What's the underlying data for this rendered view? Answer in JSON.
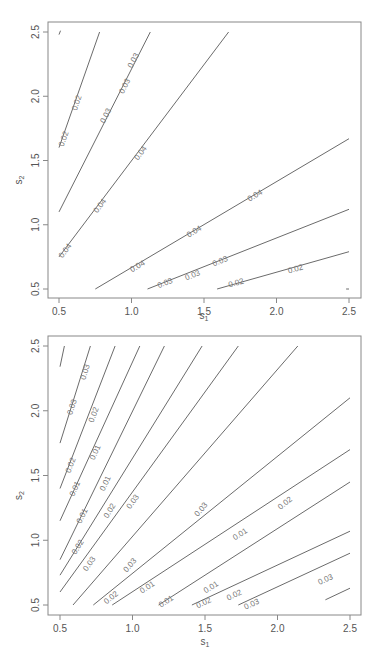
{
  "chart_data": [
    {
      "type": "contour",
      "title": "",
      "xlabel": "s1",
      "ylabel": "s2",
      "xlim": [
        0.45,
        2.58
      ],
      "ylim": [
        0.42,
        2.58
      ],
      "xticks": [
        "0.5",
        "1.0",
        "1.5",
        "2.0",
        "2.5"
      ],
      "yticks": [
        "0.5",
        "1.0",
        "1.5",
        "2.0",
        "2.5"
      ],
      "grid": false,
      "contours": [
        {
          "label": "0.02",
          "points": [
            [
              0.5,
              1.6
            ],
            [
              0.78,
              2.5
            ]
          ],
          "label_positions": [
            [
              0.53,
              1.67
            ],
            [
              0.62,
              1.95
            ]
          ]
        },
        {
          "label": "0.03",
          "points": [
            [
              0.5,
              1.1
            ],
            [
              1.13,
              2.5
            ]
          ],
          "label_positions": [
            [
              0.82,
              1.85
            ],
            [
              0.95,
              2.08
            ],
            [
              1.01,
              2.28
            ]
          ]
        },
        {
          "label": "0.04",
          "points": [
            [
              0.5,
              0.75
            ],
            [
              1.67,
              2.5
            ]
          ],
          "label_positions": [
            [
              0.54,
              0.8
            ],
            [
              0.78,
              1.15
            ],
            [
              1.06,
              1.56
            ]
          ]
        },
        {
          "label": "0.04",
          "points": [
            [
              0.75,
              0.5
            ],
            [
              2.5,
              1.67
            ]
          ],
          "label_positions": [
            [
              1.04,
              0.68
            ],
            [
              1.43,
              0.95
            ],
            [
              1.85,
              1.23
            ]
          ]
        },
        {
          "label": "0.03",
          "points": [
            [
              1.11,
              0.5
            ],
            [
              2.5,
              1.12
            ]
          ],
          "label_positions": [
            [
              1.23,
              0.55
            ],
            [
              1.42,
              0.61
            ],
            [
              1.61,
              0.72
            ]
          ]
        },
        {
          "label": "0.02",
          "points": [
            [
              1.59,
              0.5
            ],
            [
              2.5,
              0.79
            ]
          ],
          "label_positions": [
            [
              1.72,
              0.55
            ],
            [
              2.13,
              0.66
            ]
          ]
        },
        {
          "label": "",
          "points": [
            [
              0.5,
              2.48
            ],
            [
              0.51,
              2.51
            ]
          ],
          "label_positions": []
        },
        {
          "label": "",
          "points": [
            [
              2.48,
              0.5
            ],
            [
              2.5,
              0.5
            ]
          ],
          "label_positions": []
        }
      ]
    },
    {
      "type": "contour",
      "title": "",
      "xlabel": "s1",
      "ylabel": "s2",
      "xlim": [
        0.45,
        2.58
      ],
      "ylim": [
        0.42,
        2.58
      ],
      "xticks": [
        "0.5",
        "1.0",
        "1.5",
        "2.0",
        "2.5"
      ],
      "yticks": [
        "0.5",
        "1.0",
        "1.5",
        "2.0",
        "2.5"
      ],
      "grid": false,
      "contours": [
        {
          "label": "",
          "points": [
            [
              0.5,
              2.34
            ],
            [
              0.53,
              2.5
            ]
          ],
          "label_positions": []
        },
        {
          "label": "0.03",
          "points": [
            [
              0.5,
              1.75
            ],
            [
              0.71,
              2.5
            ]
          ],
          "label_positions": [
            [
              0.58,
              2.03
            ],
            [
              0.67,
              2.3
            ]
          ]
        },
        {
          "label": "0.02",
          "points": [
            [
              0.5,
              1.4
            ],
            [
              0.88,
              2.5
            ]
          ],
          "label_positions": [
            [
              0.57,
              1.58
            ],
            [
              0.73,
              1.97
            ]
          ]
        },
        {
          "label": "0.01",
          "points": [
            [
              0.5,
              1.15
            ],
            [
              1.05,
              2.5
            ]
          ],
          "label_positions": [
            [
              0.6,
              1.4
            ],
            [
              0.74,
              1.68
            ]
          ]
        },
        {
          "label": "0.01",
          "points": [
            [
              0.5,
              0.85
            ],
            [
              1.22,
              2.5
            ]
          ],
          "label_positions": [
            [
              0.65,
              1.19
            ],
            [
              0.81,
              1.44
            ]
          ]
        },
        {
          "label": "0.02",
          "points": [
            [
              0.5,
              0.73
            ],
            [
              1.48,
              2.5
            ]
          ],
          "label_positions": [
            [
              0.62,
              0.95
            ],
            [
              0.84,
              1.23
            ]
          ]
        },
        {
          "label": "0.03",
          "points": [
            [
              0.5,
              0.6
            ],
            [
              1.73,
              2.5
            ]
          ],
          "label_positions": [
            [
              0.7,
              0.82
            ],
            [
              1.0,
              1.3
            ]
          ]
        },
        {
          "label": "0.03",
          "points": [
            [
              0.59,
              0.5
            ],
            [
              2.14,
              2.5
            ]
          ],
          "label_positions": [
            [
              0.98,
              0.81
            ],
            [
              1.47,
              1.24
            ]
          ]
        },
        {
          "label": "0.02",
          "points": [
            [
              0.73,
              0.5
            ],
            [
              2.5,
              2.1
            ]
          ],
          "label_positions": [
            [
              0.85,
              0.56
            ],
            [
              2.05,
              1.29
            ]
          ]
        },
        {
          "label": "0.01",
          "points": [
            [
              0.86,
              0.5
            ],
            [
              2.5,
              1.7
            ]
          ],
          "label_positions": [
            [
              1.1,
              0.64
            ],
            [
              1.74,
              1.05
            ]
          ]
        },
        {
          "label": "0.01",
          "points": [
            [
              1.18,
              0.5
            ],
            [
              2.5,
              1.45
            ]
          ],
          "label_positions": [
            [
              1.23,
              0.53
            ],
            [
              1.54,
              0.64
            ]
          ]
        },
        {
          "label": "0.02",
          "points": [
            [
              1.41,
              0.5
            ],
            [
              2.5,
              1.07
            ]
          ],
          "label_positions": [
            [
              1.49,
              0.52
            ],
            [
              1.7,
              0.58
            ]
          ]
        },
        {
          "label": "0.03",
          "points": [
            [
              1.73,
              0.5
            ],
            [
              2.5,
              0.9
            ]
          ],
          "label_positions": [
            [
              1.82,
              0.51
            ],
            [
              2.33,
              0.7
            ]
          ]
        },
        {
          "label": "",
          "points": [
            [
              2.33,
              0.54
            ],
            [
              2.5,
              0.63
            ]
          ],
          "label_positions": []
        }
      ]
    }
  ],
  "panels": [
    {
      "box": {
        "left": 48,
        "top": 22,
        "right": 361,
        "bottom": 298
      },
      "x0px": 59,
      "x1px": 349,
      "y05px": 289,
      "y25px": 32,
      "xlabel_y": 319
    },
    {
      "box": {
        "left": 48,
        "top": 336,
        "right": 361,
        "bottom": 615
      },
      "x0px": 60,
      "x1px": 350,
      "y05px": 605,
      "y25px": 346,
      "xlabel_y": 645
    }
  ],
  "axis_labels": {
    "x": "s",
    "x_sub": "1",
    "y": "s",
    "y_sub": "2"
  },
  "colors": {
    "line": "#6b6b6b",
    "box": "#888888",
    "text": "#555555"
  }
}
